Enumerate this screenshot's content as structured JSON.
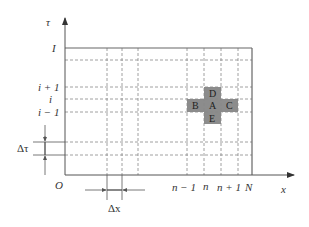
{
  "diagram": {
    "type": "finite-difference-grid",
    "axes": {
      "vertical_label": "τ",
      "horizontal_label": "x",
      "origin_label": "O"
    },
    "row_labels": {
      "top": "I",
      "i_plus_1": "i + 1",
      "i": "i",
      "i_minus_1": "i − 1"
    },
    "column_labels": {
      "n_minus_1": "n − 1",
      "n": "n",
      "n_plus_1": "n + 1",
      "right": "N"
    },
    "step_labels": {
      "time_step": "Δτ",
      "space_step": "Δx"
    },
    "stencil_cells": {
      "center": "A",
      "left": "B",
      "right": "C",
      "top": "D",
      "bottom": "E"
    },
    "colors": {
      "frame": "#777777",
      "dashed": "#999999",
      "cell_fill": "#8c8c8c",
      "text": "#333333"
    }
  }
}
